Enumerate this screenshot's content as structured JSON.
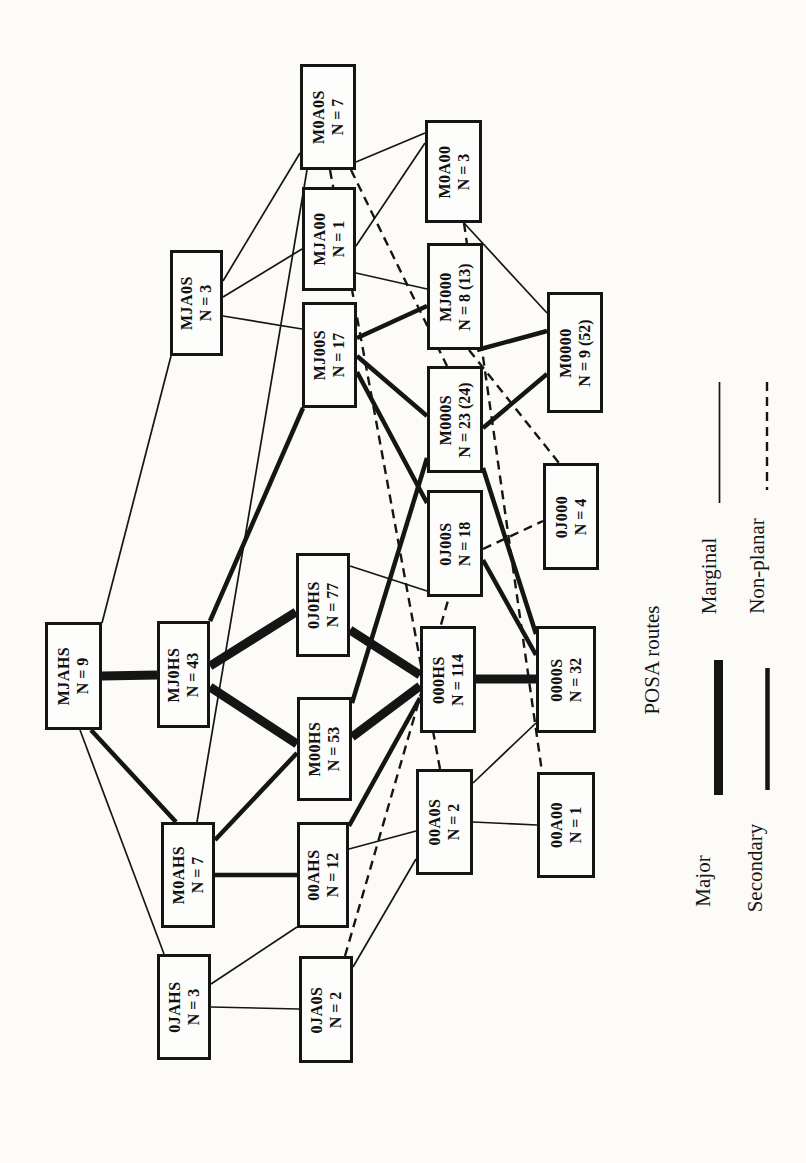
{
  "figure": {
    "background": "#fcfbf8",
    "ink": "#151515"
  },
  "legend": {
    "title": "POSA routes",
    "items": [
      {
        "label": "Major",
        "type": "major"
      },
      {
        "label": "Secondary",
        "type": "secondary"
      },
      {
        "label": "Marginal",
        "type": "marginal"
      },
      {
        "label": "Non-planar",
        "type": "nonplanar"
      }
    ]
  },
  "nodes": [
    {
      "id": "M0A0S",
      "code": "M0A0S",
      "count": "N = 7",
      "x": 300,
      "y": 64,
      "w": 56,
      "h": 106
    },
    {
      "id": "M0A00",
      "code": "M0A00",
      "count": "N = 3",
      "x": 425,
      "y": 120,
      "w": 57,
      "h": 103
    },
    {
      "id": "MJA0S",
      "code": "MJA0S",
      "count": "N = 3",
      "x": 170,
      "y": 250,
      "w": 53,
      "h": 106
    },
    {
      "id": "MJA00",
      "code": "MJA00",
      "count": "N = 1",
      "x": 302,
      "y": 187,
      "w": 54,
      "h": 104
    },
    {
      "id": "MJ00S",
      "code": "MJ00S",
      "count": "N = 17",
      "x": 302,
      "y": 302,
      "w": 55,
      "h": 106
    },
    {
      "id": "MJ000",
      "code": "MJ000",
      "count": "N = 8 (13)",
      "x": 427,
      "y": 243,
      "w": 56,
      "h": 107
    },
    {
      "id": "M0000",
      "code": "M0000",
      "count": "N = 9 (52)",
      "x": 547,
      "y": 292,
      "w": 56,
      "h": 121
    },
    {
      "id": "M000S",
      "code": "M000S",
      "count": "N = 23 (24)",
      "x": 427,
      "y": 366,
      "w": 56,
      "h": 107
    },
    {
      "id": "0J00S",
      "code": "0J00S",
      "count": "N = 18",
      "x": 427,
      "y": 490,
      "w": 56,
      "h": 107
    },
    {
      "id": "0J000",
      "code": "0J000",
      "count": "N = 4",
      "x": 543,
      "y": 463,
      "w": 56,
      "h": 107
    },
    {
      "id": "MJAHS",
      "code": "MJAHS",
      "count": "N = 9",
      "x": 45,
      "y": 622,
      "w": 57,
      "h": 108
    },
    {
      "id": "MJ0HS",
      "code": "MJ0HS",
      "count": "N = 43",
      "x": 157,
      "y": 621,
      "w": 53,
      "h": 107
    },
    {
      "id": "0J0HS",
      "code": "0J0HS",
      "count": "N = 77",
      "x": 296,
      "y": 553,
      "w": 54,
      "h": 104
    },
    {
      "id": "M00HS",
      "code": "M00HS",
      "count": "N = 53",
      "x": 297,
      "y": 697,
      "w": 55,
      "h": 104
    },
    {
      "id": "000HS",
      "code": "000HS",
      "count": "N = 114",
      "x": 420,
      "y": 626,
      "w": 56,
      "h": 107
    },
    {
      "id": "0000S",
      "code": "0000S",
      "count": "N = 32",
      "x": 536,
      "y": 626,
      "w": 60,
      "h": 107
    },
    {
      "id": "M0AHS",
      "code": "M0AHS",
      "count": "N = 7",
      "x": 161,
      "y": 822,
      "w": 54,
      "h": 106
    },
    {
      "id": "00AHS",
      "code": "00AHS",
      "count": "N = 12",
      "x": 297,
      "y": 822,
      "w": 52,
      "h": 106
    },
    {
      "id": "00A0S",
      "code": "00A0S",
      "count": "N = 2",
      "x": 416,
      "y": 769,
      "w": 57,
      "h": 106
    },
    {
      "id": "00A00",
      "code": "00A00",
      "count": "N = 1",
      "x": 537,
      "y": 772,
      "w": 58,
      "h": 106
    },
    {
      "id": "0JAHS",
      "code": "0JAHS",
      "count": "N = 3",
      "x": 157,
      "y": 954,
      "w": 54,
      "h": 106
    },
    {
      "id": "0JA0S",
      "code": "0JA0S",
      "count": "N = 2",
      "x": 299,
      "y": 956,
      "w": 54,
      "h": 107
    }
  ],
  "edges": [
    {
      "from": "MJAHS",
      "to": "MJ0HS",
      "type": "major",
      "pts": [
        102,
        676,
        157,
        675
      ]
    },
    {
      "from": "MJ0HS",
      "to": "0J0HS",
      "type": "major",
      "pts": [
        210,
        666,
        296,
        612
      ]
    },
    {
      "from": "MJ0HS",
      "to": "M00HS",
      "type": "major",
      "pts": [
        210,
        687,
        297,
        744
      ]
    },
    {
      "from": "0J0HS",
      "to": "000HS",
      "type": "major",
      "pts": [
        350,
        630,
        420,
        675
      ]
    },
    {
      "from": "M00HS",
      "to": "000HS",
      "type": "major",
      "pts": [
        352,
        737,
        420,
        686
      ]
    },
    {
      "from": "000HS",
      "to": "0000S",
      "type": "major",
      "pts": [
        476,
        679,
        536,
        679
      ]
    },
    {
      "from": "MJAHS",
      "to": "M0AHS",
      "type": "secondary",
      "pts": [
        91,
        730,
        176,
        822
      ]
    },
    {
      "from": "MJ00S",
      "to": "MJ0HS",
      "type": "secondary",
      "pts": [
        303,
        408,
        210,
        621
      ]
    },
    {
      "from": "MJ00S",
      "to": "MJ000",
      "type": "secondary",
      "pts": [
        357,
        338,
        427,
        306
      ]
    },
    {
      "from": "MJ00S",
      "to": "M000S",
      "type": "secondary",
      "pts": [
        357,
        356,
        427,
        416
      ]
    },
    {
      "from": "MJ00S",
      "to": "0J00S",
      "type": "secondary",
      "pts": [
        357,
        372,
        427,
        503
      ]
    },
    {
      "from": "M00HS",
      "to": "M000S",
      "type": "secondary",
      "pts": [
        352,
        703,
        427,
        458
      ]
    },
    {
      "from": "M0AHS",
      "to": "M00HS",
      "type": "secondary",
      "pts": [
        215,
        840,
        297,
        753
      ]
    },
    {
      "from": "M0AHS",
      "to": "00AHS",
      "type": "secondary",
      "pts": [
        215,
        875,
        297,
        875
      ]
    },
    {
      "from": "MJ000",
      "to": "M0000",
      "type": "secondary",
      "pts": [
        477,
        350,
        547,
        331
      ]
    },
    {
      "from": "M000S",
      "to": "M0000",
      "type": "secondary",
      "pts": [
        483,
        428,
        547,
        374
      ]
    },
    {
      "from": "M000S",
      "to": "0000S",
      "type": "secondary",
      "pts": [
        483,
        468,
        536,
        634
      ]
    },
    {
      "from": "0J00S",
      "to": "0000S",
      "type": "secondary",
      "pts": [
        483,
        560,
        536,
        655
      ]
    },
    {
      "from": "00AHS",
      "to": "000HS",
      "type": "secondary",
      "pts": [
        349,
        826,
        420,
        698
      ]
    },
    {
      "from": "MJAHS",
      "to": "MJA0S",
      "type": "marginal",
      "pts": [
        102,
        623,
        171,
        356
      ]
    },
    {
      "from": "MJAHS",
      "to": "0JAHS",
      "type": "marginal",
      "pts": [
        80,
        730,
        164,
        954
      ]
    },
    {
      "from": "MJA0S",
      "to": "M0A0S",
      "type": "marginal",
      "pts": [
        223,
        281,
        300,
        153
      ]
    },
    {
      "from": "MJA0S",
      "to": "MJA00",
      "type": "marginal",
      "pts": [
        223,
        297,
        302,
        249
      ]
    },
    {
      "from": "MJA0S",
      "to": "MJ00S",
      "type": "marginal",
      "pts": [
        223,
        316,
        302,
        329
      ]
    },
    {
      "from": "M0AHS",
      "to": "M0A0S",
      "type": "marginal",
      "pts": [
        197,
        822,
        307,
        170
      ]
    },
    {
      "from": "M0A0S",
      "to": "M0A00",
      "type": "marginal",
      "pts": [
        356,
        162,
        425,
        133
      ]
    },
    {
      "from": "MJA00",
      "to": "M0A00",
      "type": "marginal",
      "pts": [
        356,
        246,
        425,
        143
      ]
    },
    {
      "from": "MJA00",
      "to": "MJ000",
      "type": "marginal",
      "pts": [
        356,
        273,
        427,
        289
      ]
    },
    {
      "from": "M0A00",
      "to": "M0000",
      "type": "marginal",
      "pts": [
        464,
        223,
        547,
        313
      ]
    },
    {
      "from": "0J0HS",
      "to": "0J00S",
      "type": "marginal",
      "pts": [
        350,
        566,
        427,
        591
      ]
    },
    {
      "from": "0JAHS",
      "to": "0JA0S",
      "type": "marginal",
      "pts": [
        211,
        1007,
        299,
        1009
      ]
    },
    {
      "from": "00AHS",
      "to": "0JAHS",
      "type": "marginal",
      "pts": [
        297,
        927,
        211,
        984
      ]
    },
    {
      "from": "00AHS",
      "to": "00A0S",
      "type": "marginal",
      "pts": [
        349,
        849,
        416,
        831
      ]
    },
    {
      "from": "0JA0S",
      "to": "00A0S",
      "type": "marginal",
      "pts": [
        353,
        967,
        416,
        859
      ]
    },
    {
      "from": "00A0S",
      "to": "00A00",
      "type": "marginal",
      "pts": [
        473,
        822,
        537,
        825
      ]
    },
    {
      "from": "00A0S",
      "to": "0000S",
      "type": "marginal",
      "pts": [
        473,
        783,
        536,
        723
      ]
    },
    {
      "from": "M0A0S",
      "to": "M000S",
      "type": "nonplanar",
      "pts": [
        351,
        170,
        447,
        366
      ]
    },
    {
      "from": "M0A0S",
      "to": "00A0S",
      "type": "nonplanar",
      "pts": [
        330,
        170,
        440,
        769
      ]
    },
    {
      "from": "M0A00",
      "to": "00A00",
      "type": "nonplanar",
      "pts": [
        464,
        223,
        542,
        772
      ]
    },
    {
      "from": "MJ000",
      "to": "0J000",
      "type": "nonplanar",
      "pts": [
        469,
        350,
        559,
        463
      ]
    },
    {
      "from": "0J00S",
      "to": "0J000",
      "type": "nonplanar",
      "pts": [
        483,
        549,
        543,
        521
      ]
    },
    {
      "from": "0JA0S",
      "to": "0J00S",
      "type": "nonplanar",
      "pts": [
        345,
        956,
        449,
        597
      ]
    }
  ],
  "legend_samples": [
    {
      "type": "marginal",
      "pts": [
        719.5,
        382,
        719.5,
        503
      ]
    },
    {
      "type": "nonplanar",
      "pts": [
        767,
        382,
        767,
        490
      ]
    },
    {
      "type": "major",
      "pts": [
        718.5,
        660,
        718.5,
        795
      ]
    },
    {
      "type": "secondary",
      "pts": [
        767.5,
        668,
        767.5,
        790
      ]
    }
  ]
}
